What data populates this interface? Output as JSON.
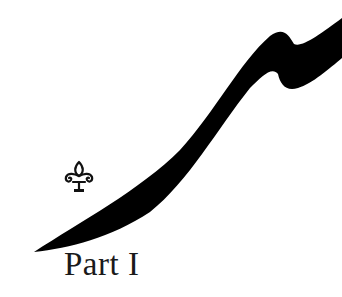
{
  "page": {
    "title": "Part I",
    "ornament": "fleur-de-lis-icon",
    "decoration": "brush-stroke",
    "colors": {
      "ink": "#000000",
      "text": "#1a1a1a",
      "background": "#ffffff"
    }
  }
}
